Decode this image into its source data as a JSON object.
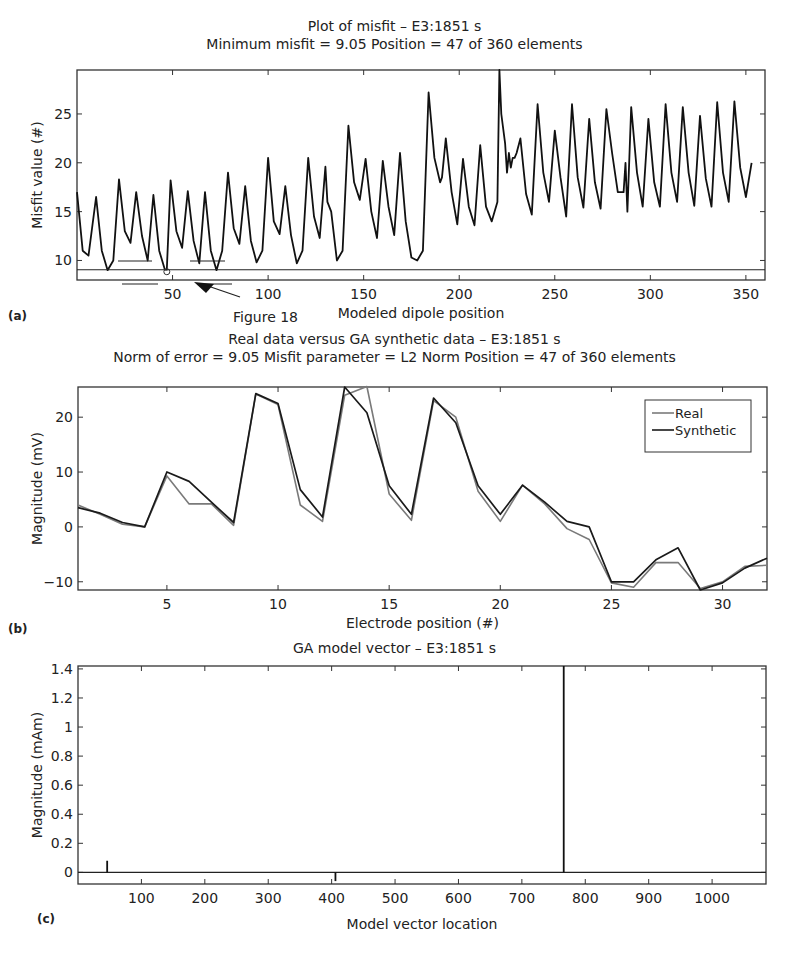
{
  "chart_data": [
    {
      "id": "a",
      "type": "line",
      "panel_label": "(a)",
      "title": "Plot of misfit – E3:1851 s",
      "subtitle": "Minimum misfit = 9.05    Position = 47 of 360 elements",
      "xlabel": "Modeled dipole position",
      "ylabel": "Misfit value (#)",
      "xlim": [
        0,
        360
      ],
      "ylim": [
        8,
        29.5
      ],
      "xticks": [
        50,
        100,
        150,
        200,
        250,
        300,
        350
      ],
      "yticks": [
        10,
        15,
        20,
        25
      ],
      "grid": false,
      "annotation": {
        "text": "Figure 18",
        "points_to_x": 62,
        "min_marker_x": 47,
        "min_marker_y": 9.05
      },
      "minimum_line_y": 9.05,
      "series": [
        {
          "name": "Misfit",
          "color": "#111111",
          "x": [
            0,
            3,
            6,
            10,
            13,
            16,
            19,
            22,
            25,
            28,
            31,
            34,
            37,
            40,
            43,
            46,
            47,
            49,
            52,
            55,
            58,
            61,
            64,
            67,
            70,
            73,
            76,
            79,
            82,
            85,
            88,
            91,
            94,
            97,
            100,
            103,
            106,
            109,
            112,
            115,
            118,
            121,
            124,
            127,
            130,
            131,
            133,
            136,
            139,
            142,
            145,
            148,
            151,
            154,
            157,
            160,
            163,
            166,
            169,
            172,
            175,
            178,
            181,
            184,
            187,
            190,
            191,
            193,
            196,
            199,
            202,
            205,
            208,
            211,
            214,
            217,
            220,
            221,
            222,
            224,
            225,
            226,
            227,
            228,
            229,
            230,
            232,
            235,
            238,
            241,
            244,
            247,
            250,
            253,
            256,
            259,
            262,
            265,
            268,
            271,
            274,
            277,
            280,
            283,
            286,
            287,
            288,
            290,
            293,
            296,
            299,
            302,
            305,
            308,
            311,
            314,
            317,
            320,
            323,
            326,
            329,
            332,
            335,
            338,
            341,
            344,
            347,
            350,
            353,
            356,
            360
          ],
          "values": [
            17,
            11,
            10.5,
            16.5,
            11,
            9,
            10,
            18.3,
            13,
            11.8,
            17,
            12.5,
            10,
            16.7,
            11,
            9.05,
            9.05,
            18.2,
            13,
            11.3,
            17.1,
            12,
            9.7,
            17,
            11,
            9,
            11,
            19,
            13.3,
            11.7,
            17.6,
            12,
            9.8,
            11,
            20.5,
            14,
            12.7,
            17.6,
            12.6,
            9.7,
            11,
            20.5,
            14.5,
            12.3,
            19.6,
            16,
            15,
            10,
            11,
            23.8,
            18,
            16.2,
            20.4,
            15,
            12.3,
            20.2,
            15.5,
            12.6,
            21,
            14,
            10.3,
            10,
            11,
            27.2,
            20.5,
            18,
            18.5,
            22.5,
            17,
            13.7,
            20.4,
            15.5,
            13.6,
            21.8,
            15.5,
            14,
            16,
            29.5,
            25,
            22,
            19,
            21,
            19.5,
            20.5,
            20.5,
            21,
            22.5,
            16.8,
            14.7,
            26,
            19,
            16,
            23.3,
            18.5,
            14.5,
            26,
            18.5,
            15.4,
            24.5,
            18,
            15.3,
            25.5,
            21,
            17,
            17,
            20,
            15,
            25.7,
            19,
            15.5,
            24.5,
            18,
            15.5,
            26,
            19,
            16,
            25.7,
            19,
            15.6,
            24.8,
            18.4,
            15.5,
            26.2,
            19,
            16,
            26.3,
            19.5,
            16.5,
            20
          ]
        }
      ]
    },
    {
      "id": "b",
      "type": "line",
      "panel_label": "(b)",
      "title": "Real data versus GA synthetic data – E3:1851 s",
      "subtitle": "Norm of error = 9.05    Misfit parameter = L2 Norm    Position = 47 of 360 elements",
      "xlabel": "Electrode position (#)",
      "ylabel": "Magnitude (mV)",
      "xlim": [
        1,
        32
      ],
      "ylim": [
        -11.5,
        25.5
      ],
      "xticks": [
        5,
        10,
        15,
        20,
        25,
        30
      ],
      "yticks": [
        -10,
        0,
        10,
        20
      ],
      "grid": false,
      "legend_position": "upper right",
      "x": [
        1,
        2,
        3,
        4,
        5,
        6,
        7,
        8,
        9,
        10,
        11,
        12,
        13,
        14,
        15,
        16,
        17,
        18,
        19,
        20,
        21,
        22,
        23,
        24,
        25,
        26,
        27,
        28,
        29,
        30,
        31,
        32
      ],
      "series": [
        {
          "name": "Real",
          "color": "#7a7a7a",
          "values": [
            4,
            2.3,
            0.5,
            0,
            9.3,
            4.2,
            4.2,
            0.3,
            24.2,
            22.3,
            4,
            1,
            24,
            25.6,
            6,
            1.2,
            23,
            20,
            6.5,
            1,
            7.6,
            4.2,
            -0.3,
            -2.3,
            -10.2,
            -11,
            -6.5,
            -6.5,
            -11.2,
            -10,
            -7.2,
            -7
          ]
        },
        {
          "name": "Synthetic",
          "color": "#1a1a1a",
          "values": [
            3.5,
            2.5,
            0.8,
            0,
            10,
            8.3,
            4.5,
            0.8,
            24.3,
            22.5,
            6.8,
            1.8,
            25.5,
            20.8,
            7.5,
            2.3,
            23.5,
            19,
            7.5,
            2.3,
            7.6,
            4.5,
            1,
            0,
            -10,
            -10,
            -6,
            -3.8,
            -11.5,
            -10.2,
            -7.5,
            -5.7
          ]
        }
      ]
    },
    {
      "id": "c",
      "type": "bar",
      "panel_label": "(c)",
      "title": "GA model vector – E3:1851 s",
      "xlabel": "Model vector location",
      "ylabel": "Magnitude (mAm)",
      "xlim": [
        0,
        1085
      ],
      "ylim": [
        -0.08,
        1.42
      ],
      "xticks": [
        100,
        200,
        300,
        400,
        500,
        600,
        700,
        800,
        900,
        1000
      ],
      "yticks": [
        0,
        0.2,
        0.4,
        0.6,
        0.8,
        1,
        1.2,
        1.4
      ],
      "ytick_labels": [
        "0",
        "0.2",
        "0.4",
        "0.6",
        "0.8",
        "1",
        "1.2",
        "1.4"
      ],
      "grid": false,
      "x": [
        46,
        406,
        766
      ],
      "values": [
        0.08,
        -0.06,
        1.42
      ]
    }
  ]
}
